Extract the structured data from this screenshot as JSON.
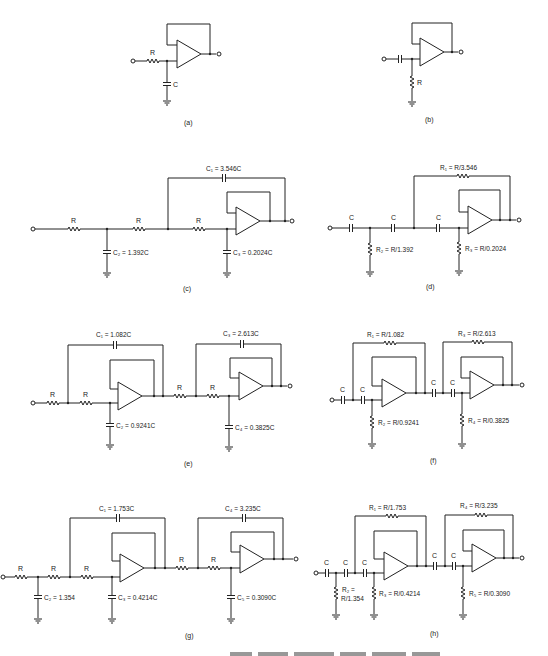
{
  "figure": {
    "caption_partial": "Fig. — Butterworth low-pass and high-pass filters (cut off)",
    "panels": [
      {
        "id": "a",
        "label": "(a)",
        "type": "low-pass first order",
        "components": {
          "R": "R",
          "C": "C"
        }
      },
      {
        "id": "b",
        "label": "(b)",
        "type": "high-pass first order",
        "components": {
          "R": "R"
        }
      },
      {
        "id": "c",
        "label": "(c)",
        "type": "low-pass third order",
        "components": {
          "R1": "R",
          "R2": "R",
          "R3": "R",
          "C1": "C1 = 3.546C",
          "C2": "C2 = 1.392C",
          "C3": "C3 = 0.2024C"
        }
      },
      {
        "id": "d",
        "label": "(d)",
        "type": "high-pass third order",
        "components": {
          "C_a": "C",
          "C_b": "C",
          "C_c": "C",
          "R1": "R1 = R/3.546",
          "R2": "R2 = R/1.392",
          "R3": "R3 = R/0.2024"
        }
      },
      {
        "id": "e",
        "label": "(e)",
        "type": "low-pass fourth order",
        "components": {
          "R_a": "R",
          "R_b": "R",
          "R_c": "R",
          "R_d": "R",
          "C1": "C1 = 1.082C",
          "C2": "C2 = 0.9241C",
          "C3": "C3 = 2.613C",
          "C4": "C4 = 0.3825C"
        }
      },
      {
        "id": "f",
        "label": "(f)",
        "type": "high-pass fourth order",
        "components": {
          "C_a": "C",
          "C_b": "C",
          "C_c": "C",
          "C_d": "C",
          "R1": "R1 = R/1.082",
          "R2": "R2 = R/0.9241",
          "R3": "R3 = R/2.613",
          "R4": "R4 = R/0.3825"
        }
      },
      {
        "id": "g",
        "label": "(g)",
        "type": "low-pass fifth order",
        "components": {
          "R_a": "R",
          "R_b": "R",
          "R_c": "R",
          "R_d": "R",
          "R_e": "R",
          "C1": "C1 = 1.753C",
          "C2": "C2 = 1.354",
          "C3": "C3 = 0.4214C",
          "C4": "C4 = 3.235C",
          "C5": "C5 = 0.3090C"
        }
      },
      {
        "id": "h",
        "label": "(h)",
        "type": "high-pass fifth order",
        "components": {
          "C_a": "C",
          "C_b": "C",
          "C_c": "C",
          "C_d": "C",
          "C_e": "C",
          "R1": "R1 = R/1.753",
          "R2_line1": "R2 =",
          "R2_line2": "R/1.354",
          "R3": "R3 = R/0.4214",
          "R4": "R4 = R/3.235",
          "R5": "R5 = R/0.3090"
        }
      }
    ]
  },
  "labels": {
    "a_R": "R",
    "a_C": "C",
    "a_tag": "(a)",
    "b_R": "R",
    "b_tag": "(b)",
    "c_R1": "R",
    "c_R2": "R",
    "c_R3": "R",
    "c_C1": "C₁ = 3.546C",
    "c_C2": "C₂ = 1.392C",
    "c_C3": "C₃ = 0.2024C",
    "c_tag": "(c)",
    "d_C1": "C",
    "d_C2": "C",
    "d_C3": "C",
    "d_R1": "R₁ = R/3.546",
    "d_R2": "R₂ = R/1.392",
    "d_R3": "R₃ = R/0.2024",
    "d_tag": "(d)",
    "e_R1": "R",
    "e_R2": "R",
    "e_R3": "R",
    "e_R4": "R",
    "e_C1": "C₁ = 1.082C",
    "e_C2": "C₂ = 0.9241C",
    "e_C3": "C₃ = 2.613C",
    "e_C4": "C₄ = 0.3825C",
    "e_tag": "(e)",
    "f_C1": "C",
    "f_C2": "C",
    "f_C3": "C",
    "f_C4": "C",
    "f_R1": "R₁ = R/1.082",
    "f_R2": "R₂ = R/0.9241",
    "f_R3": "R₃ = R/2.613",
    "f_R4": "R₄ = R/0.3825",
    "f_tag": "(f)",
    "g_R1": "R",
    "g_R2": "R",
    "g_R3": "R",
    "g_R4": "R",
    "g_R5": "R",
    "g_C1": "C₁ = 1.753C",
    "g_C2": "C₂ = 1.354",
    "g_C3": "C₃ = 0.4214C",
    "g_C4": "C₄ = 3.235C",
    "g_C5": "C₅ = 0.3090C",
    "g_tag": "(g)",
    "h_C1": "C",
    "h_C2": "C",
    "h_C3": "C",
    "h_C4": "C",
    "h_C5": "C",
    "h_R1": "R₁ = R/1.753",
    "h_R2a": "R₂ =",
    "h_R2b": "R/1.354",
    "h_R3": "R₃ = R/0.4214",
    "h_R4": "R₄ = R/3.235",
    "h_R5": "R₅ = R/0.3090",
    "h_tag": "(h)"
  }
}
